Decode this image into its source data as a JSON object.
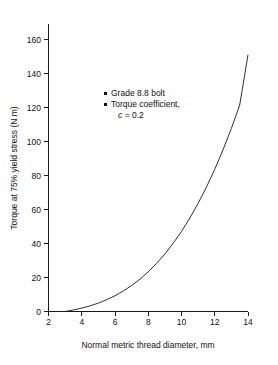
{
  "chart_data": {
    "type": "line",
    "title": "",
    "subtitle": "",
    "xlabel": "Normal metric thread diameter, mm",
    "ylabel": "Torque at 75% yield stress (N m)",
    "xlim": [
      2,
      14
    ],
    "ylim": [
      0,
      168
    ],
    "xticks": [
      2,
      4,
      6,
      8,
      10,
      12,
      14
    ],
    "yticks": [
      0,
      20,
      40,
      60,
      80,
      100,
      120,
      140,
      160
    ],
    "xtick_labels": [
      "2",
      "4",
      "6",
      "8",
      "10",
      "12",
      "14"
    ],
    "ytick_labels": [
      "0",
      "20",
      "40",
      "60",
      "80",
      "100",
      "120",
      "140",
      "160"
    ],
    "grid": false,
    "legend_position": "upper-left-inside",
    "series": [
      {
        "name": "Grade 8.8 bolt, c = 0.2",
        "x": [
          3.0,
          3.5,
          4.0,
          4.5,
          5.0,
          5.5,
          6.0,
          6.5,
          7.0,
          7.5,
          8.0,
          8.5,
          9.0,
          9.5,
          10.0,
          10.5,
          11.0,
          11.5,
          12.0,
          12.5,
          13.0,
          13.5,
          14.0
        ],
        "y": [
          0.0,
          0.9,
          2.0,
          3.3,
          4.9,
          6.9,
          9.2,
          12.0,
          15.2,
          18.9,
          23.2,
          28.1,
          33.6,
          39.9,
          46.8,
          54.6,
          63.2,
          72.7,
          83.1,
          94.5,
          107.0,
          120.6,
          150.0
        ]
      }
    ],
    "annotations": [
      "Grade 8.8 bolt",
      "Torque coefficient,",
      "c = 0.2"
    ]
  },
  "legend": {
    "item1": "Grade 8.8 bolt",
    "item2": "Torque coefficient,",
    "item2_sub_symbol": "c",
    "item2_sub_value": "= 0.2"
  }
}
